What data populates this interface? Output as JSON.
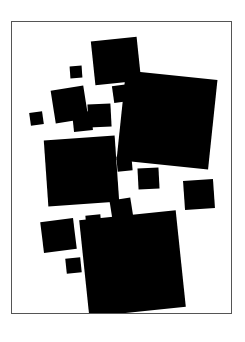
{
  "artwork": {
    "title": "Abstract Composition of Black Squares",
    "canvas": {
      "width": 245,
      "height": 342,
      "background_color": "#ffffff"
    },
    "frame": {
      "name": "thin rectangular border",
      "left": 11,
      "top": 21,
      "width": 221,
      "height": 293,
      "border_color": "#555555",
      "border_width": 1,
      "fill_color": "#ffffff"
    },
    "shape_color": "#000000",
    "shape_count": 17,
    "shapes": [
      {
        "id": "square-01",
        "size": "large",
        "left": 93,
        "top": 39,
        "width": 46,
        "height": 44,
        "rotation": -6
      },
      {
        "id": "square-02",
        "size": "tiny",
        "left": 70,
        "top": 66,
        "width": 12,
        "height": 12,
        "rotation": -4
      },
      {
        "id": "square-03",
        "size": "xlarge",
        "left": 121,
        "top": 75,
        "width": 92,
        "height": 90,
        "rotation": 6
      },
      {
        "id": "square-04",
        "size": "small",
        "left": 113,
        "top": 85,
        "width": 17,
        "height": 17,
        "rotation": -8
      },
      {
        "id": "square-05",
        "size": "medium",
        "left": 53,
        "top": 88,
        "width": 33,
        "height": 33,
        "rotation": -9
      },
      {
        "id": "square-06",
        "size": "medium",
        "left": 88,
        "top": 104,
        "width": 23,
        "height": 23,
        "rotation": -3
      },
      {
        "id": "square-07",
        "size": "tiny",
        "left": 30,
        "top": 112,
        "width": 13,
        "height": 13,
        "rotation": -8
      },
      {
        "id": "square-08",
        "size": "small",
        "left": 73,
        "top": 112,
        "width": 19,
        "height": 19,
        "rotation": -6
      },
      {
        "id": "square-09",
        "size": "xlarge",
        "left": 46,
        "top": 138,
        "width": 71,
        "height": 66,
        "rotation": -4
      },
      {
        "id": "square-10",
        "size": "small",
        "left": 117,
        "top": 156,
        "width": 15,
        "height": 15,
        "rotation": -5
      },
      {
        "id": "square-11",
        "size": "medium",
        "left": 138,
        "top": 168,
        "width": 21,
        "height": 21,
        "rotation": -3
      },
      {
        "id": "square-12",
        "size": "medium",
        "left": 184,
        "top": 180,
        "width": 30,
        "height": 29,
        "rotation": -4
      },
      {
        "id": "square-13",
        "size": "medium",
        "left": 111,
        "top": 199,
        "width": 21,
        "height": 21,
        "rotation": -9
      },
      {
        "id": "square-14",
        "size": "xlarge",
        "left": 84,
        "top": 215,
        "width": 97,
        "height": 97,
        "rotation": -6
      },
      {
        "id": "square-15",
        "size": "small",
        "left": 86,
        "top": 215,
        "width": 15,
        "height": 15,
        "rotation": -5
      },
      {
        "id": "square-16",
        "size": "medium",
        "left": 42,
        "top": 220,
        "width": 33,
        "height": 31,
        "rotation": -7
      },
      {
        "id": "square-17",
        "size": "small",
        "left": 66,
        "top": 258,
        "width": 15,
        "height": 15,
        "rotation": -6
      }
    ]
  }
}
